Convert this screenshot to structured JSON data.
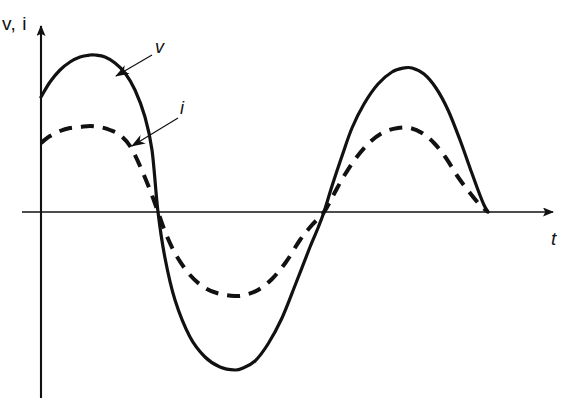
{
  "figure": {
    "background_color": "#ffffff",
    "ink_color": "#111111",
    "width": 565,
    "height": 398
  },
  "axes": {
    "vertical_label": "v, i",
    "horizontal_label": "t",
    "origin_x": 41,
    "origin_y": 212,
    "vertical_arrow": "up-arrow-icon",
    "horizontal_arrow": "right-arrow-icon"
  },
  "annotations": [
    {
      "name": "voltage-callout",
      "label": "v",
      "label_x": 155,
      "label_y": 37,
      "leader_from": [
        152,
        55
      ],
      "leader_to": [
        116,
        76
      ],
      "arrowhead": "arrowhead-icon"
    },
    {
      "name": "current-callout",
      "label": "i",
      "label_x": 180,
      "label_y": 98,
      "leader_from": [
        178,
        118
      ],
      "leader_to": [
        132,
        146
      ],
      "arrowhead": "arrowhead-icon"
    }
  ],
  "chart_data": {
    "type": "line",
    "title": "",
    "subtitle": "",
    "xlabel": "t",
    "ylabel": "v, i",
    "grid": false,
    "legend": "inline-callout-labels",
    "axis_style": "arrowed-axes-no-ticks",
    "xlim": [
      0,
      1
    ],
    "ylim": [
      -1.15,
      1.15
    ],
    "x_zero_crossings": [
      158,
      324,
      488
    ],
    "series": [
      {
        "name": "v",
        "style": "solid",
        "line_width": 3.2,
        "amplitude": 1.0,
        "phase_note": "starts at 0.41 of peak on rising edge",
        "points": [
          [
            41,
            97
          ],
          [
            50,
            82
          ],
          [
            60,
            70
          ],
          [
            70,
            62
          ],
          [
            80,
            57
          ],
          [
            90,
            55
          ],
          [
            95,
            55
          ],
          [
            105,
            57
          ],
          [
            115,
            63
          ],
          [
            125,
            73
          ],
          [
            135,
            90
          ],
          [
            145,
            117
          ],
          [
            152,
            150
          ],
          [
            158,
            212
          ],
          [
            165,
            258
          ],
          [
            175,
            300
          ],
          [
            190,
            337
          ],
          [
            205,
            357
          ],
          [
            220,
            367
          ],
          [
            235,
            370
          ],
          [
            243,
            368
          ],
          [
            255,
            361
          ],
          [
            268,
            344
          ],
          [
            282,
            318
          ],
          [
            296,
            283
          ],
          [
            310,
            247
          ],
          [
            318,
            228
          ],
          [
            324,
            212
          ],
          [
            332,
            186
          ],
          [
            342,
            156
          ],
          [
            352,
            128
          ],
          [
            364,
            104
          ],
          [
            378,
            84
          ],
          [
            392,
            72
          ],
          [
            404,
            68
          ],
          [
            412,
            68
          ],
          [
            424,
            74
          ],
          [
            436,
            88
          ],
          [
            448,
            110
          ],
          [
            460,
            140
          ],
          [
            470,
            168
          ],
          [
            478,
            190
          ],
          [
            484,
            205
          ],
          [
            488,
            212
          ]
        ]
      },
      {
        "name": "i",
        "style": "dashed",
        "line_width": 4.0,
        "dash_pattern": "13 9",
        "amplitude": 0.62,
        "phase_note": "in phase with v, smaller amplitude",
        "points": [
          [
            41,
            143
          ],
          [
            50,
            136
          ],
          [
            60,
            131
          ],
          [
            70,
            128
          ],
          [
            80,
            127
          ],
          [
            90,
            126
          ],
          [
            100,
            127
          ],
          [
            110,
            130
          ],
          [
            120,
            135
          ],
          [
            130,
            146
          ],
          [
            140,
            166
          ],
          [
            150,
            190
          ],
          [
            158,
            212
          ],
          [
            166,
            234
          ],
          [
            176,
            255
          ],
          [
            190,
            275
          ],
          [
            205,
            288
          ],
          [
            220,
            294
          ],
          [
            235,
            296
          ],
          [
            245,
            295
          ],
          [
            258,
            290
          ],
          [
            272,
            279
          ],
          [
            286,
            262
          ],
          [
            300,
            240
          ],
          [
            312,
            225
          ],
          [
            324,
            212
          ],
          [
            334,
            194
          ],
          [
            344,
            176
          ],
          [
            356,
            158
          ],
          [
            370,
            142
          ],
          [
            384,
            132
          ],
          [
            398,
            128
          ],
          [
            410,
            128
          ],
          [
            422,
            133
          ],
          [
            434,
            143
          ],
          [
            446,
            158
          ],
          [
            458,
            177
          ],
          [
            470,
            193
          ],
          [
            480,
            205
          ],
          [
            488,
            212
          ]
        ]
      }
    ]
  }
}
